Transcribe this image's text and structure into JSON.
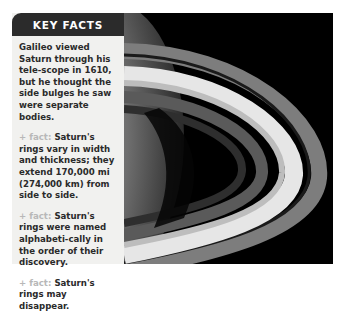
{
  "key_facts": {
    "title": "KEY FACTS",
    "intro": "Galileo viewed Saturn through his tele-scope in 1610, but he thought the side bulges he saw were separate bodies.",
    "facts": [
      {
        "tag": "+ fact:",
        "text": "Saturn's rings vary in width and thickness; they extend 170,000 mi (274,000 km) from side to side."
      },
      {
        "tag": "+ fact:",
        "text": "Saturn's rings were named alphabeti-cally in the order of their discovery."
      },
      {
        "tag": "+ fact:",
        "text": "Saturn's rings may disappear."
      }
    ]
  },
  "photo": {
    "subject": "saturn-rings-photo",
    "colors": {
      "background": "#000000",
      "ring_bright": "#e8e8e8",
      "ring_mid": "#9a9a9a",
      "planet": "#8a8a8a"
    }
  }
}
